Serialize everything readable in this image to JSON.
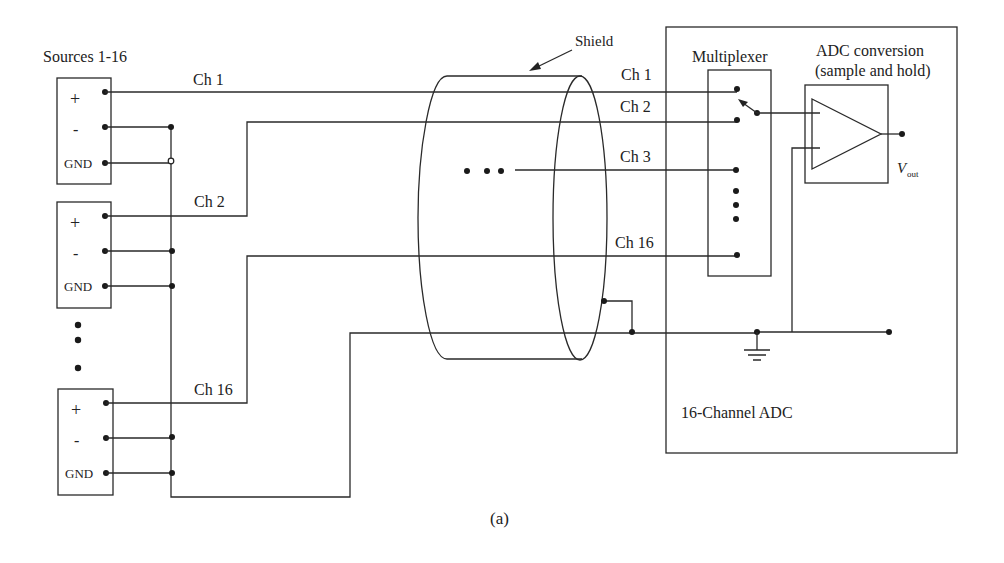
{
  "diagram": {
    "caption": "(a)",
    "sources": {
      "title": "Sources 1-16",
      "boxes": [
        {
          "pins": [
            "+",
            "-",
            "GND"
          ]
        },
        {
          "pins": [
            "+",
            "-",
            "GND"
          ]
        },
        {
          "pins": [
            "+",
            "-",
            "GND"
          ]
        }
      ]
    },
    "left_channel_labels": [
      "Ch 1",
      "Ch 2",
      "Ch 16"
    ],
    "shield": {
      "label": "Shield"
    },
    "right_channel_labels": [
      "Ch 1",
      "Ch 2",
      "Ch 3",
      "Ch 16"
    ],
    "adc": {
      "title": "16-Channel ADC",
      "multiplexer_label": "Multiplexer",
      "conversion_label_line1": "ADC conversion",
      "conversion_label_line2": "(sample and hold)",
      "output_label": "V",
      "output_subscript": "out"
    }
  }
}
